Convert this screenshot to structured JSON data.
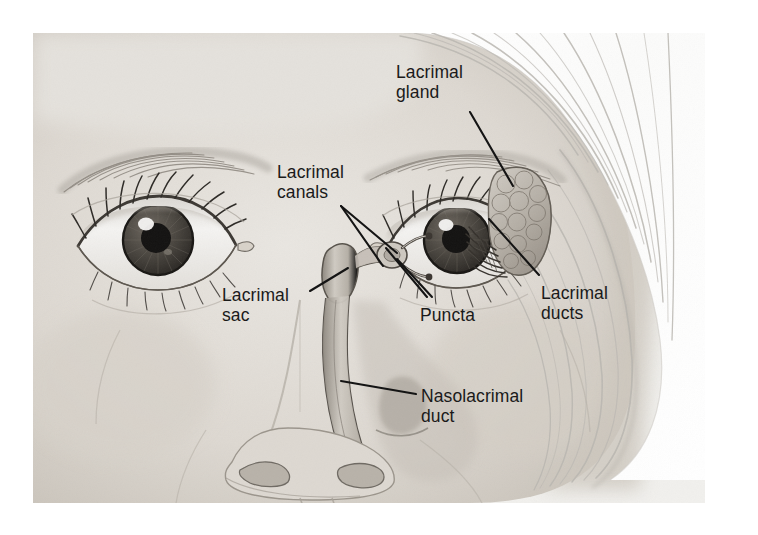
{
  "figure": {
    "kind": "anatomical-illustration",
    "medium": "graphite pencil drawing, grayscale",
    "canvas": {
      "width": 758,
      "height": 535,
      "background": "#ffffff"
    },
    "plate": {
      "x": 33,
      "y": 33,
      "width": 672,
      "height": 470,
      "paper_tone": "#ededea"
    }
  },
  "palette": {
    "label_text": "#1a1a1a",
    "leader_line": "#111111",
    "paper": "#ededea",
    "skin_light": "#e6e3de",
    "skin_mid": "#d2cdc6",
    "skin_shadow": "#b3ada4",
    "hair_light": "#fbfbfa",
    "hair_stroke": "#b9b6b0",
    "iris": "#4a4641",
    "pupil": "#141414",
    "sclera": "#f2f1ee",
    "duct_fill": "#c8c3bb",
    "duct_outline": "#57524b",
    "gland_fill": "#bdb8b0",
    "gland_outline": "#6b655d"
  },
  "labels": [
    {
      "id": "lacrimal-gland",
      "text": "Lacrimal\ngland",
      "x": 396,
      "y": 62,
      "align": "left"
    },
    {
      "id": "lacrimal-canals",
      "text": "Lacrimal\ncanals",
      "x": 277,
      "y": 162,
      "align": "left"
    },
    {
      "id": "lacrimal-sac",
      "text": "Lacrimal\nsac",
      "x": 222,
      "y": 285,
      "align": "left"
    },
    {
      "id": "puncta",
      "text": "Puncta",
      "x": 420,
      "y": 305,
      "align": "left"
    },
    {
      "id": "lacrimal-ducts",
      "text": "Lacrimal\nducts",
      "x": 541,
      "y": 283,
      "align": "left"
    },
    {
      "id": "nasolacrimal-duct",
      "text": "Nasolacrimal\nduct",
      "x": 421,
      "y": 386,
      "align": "left"
    }
  ],
  "leader_lines": [
    {
      "id": "leader-lacrimal-gland",
      "from_label": "lacrimal-gland",
      "points": [
        [
          470,
          112
        ],
        [
          513,
          186
        ]
      ]
    },
    {
      "id": "leader-canal-upper",
      "from_label": "lacrimal-canals",
      "points": [
        [
          341,
          206
        ],
        [
          397,
          253
        ]
      ]
    },
    {
      "id": "leader-canal-lower",
      "from_label": "lacrimal-canals",
      "points": [
        [
          341,
          206
        ],
        [
          383,
          266
        ]
      ]
    },
    {
      "id": "leader-lacrimal-sac",
      "from_label": "lacrimal-sac",
      "points": [
        [
          310,
          291
        ],
        [
          348,
          268
        ]
      ]
    },
    {
      "id": "leader-puncta-upper",
      "from_label": "puncta",
      "points": [
        [
          427,
          297
        ],
        [
          386,
          248
        ]
      ]
    },
    {
      "id": "leader-puncta-lower",
      "from_label": "puncta",
      "points": [
        [
          432,
          297
        ],
        [
          397,
          259
        ]
      ]
    },
    {
      "id": "leader-lacrimal-ducts",
      "from_label": "lacrimal-ducts",
      "points": [
        [
          539,
          275
        ],
        [
          489,
          219
        ]
      ]
    },
    {
      "id": "leader-nasolacrimal-duct",
      "from_label": "nasolacrimal-duct",
      "points": [
        [
          416,
          394
        ],
        [
          341,
          381
        ]
      ]
    }
  ],
  "structures": [
    {
      "id": "lacrimal-gland-mass",
      "name": "Lacrimal gland",
      "description": "lobulated almond-shaped gland above the outer corner of the subject's left eye (image right)"
    },
    {
      "id": "lacrimal-duct-fan",
      "name": "Lacrimal ducts",
      "description": "fan of fine ducts running from gland down into the upper eyelid"
    },
    {
      "id": "lacrimal-canal-upper",
      "name": "Upper lacrimal canal",
      "description": "canaliculus from upper punctum to the lacrimal sac"
    },
    {
      "id": "lacrimal-canal-lower",
      "name": "Lower lacrimal canal",
      "description": "canaliculus from lower punctum to the lacrimal sac"
    },
    {
      "id": "punctum-upper",
      "name": "Upper punctum",
      "description": "opening on the medial upper lid margin"
    },
    {
      "id": "punctum-lower",
      "name": "Lower punctum",
      "description": "opening on the medial lower lid margin"
    },
    {
      "id": "lacrimal-sac-body",
      "name": "Lacrimal sac",
      "description": "dilated sac medial to the eye, draining downward"
    },
    {
      "id": "nasolacrimal-duct-tube",
      "name": "Nasolacrimal duct",
      "description": "duct descending beside the nose into the nasal cavity"
    },
    {
      "id": "eye-left",
      "name": "Left eye",
      "description": "subject's right eye, image left"
    },
    {
      "id": "eye-right",
      "name": "Right eye",
      "description": "subject's left eye, image right, with cutaway"
    },
    {
      "id": "nose",
      "name": "Nose",
      "description": "nose with nostrils, cut away to reveal duct"
    },
    {
      "id": "hair",
      "name": "Hair",
      "description": "pale swept hair across upper right"
    }
  ]
}
